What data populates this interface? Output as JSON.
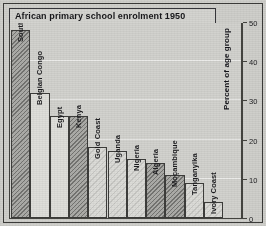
{
  "chart_data": {
    "type": "bar",
    "title": "African primary school enrolment 1950",
    "xlabel": "",
    "ylabel": "Percent of age group",
    "ylim": [
      0,
      50
    ],
    "yticks": [
      0,
      10,
      20,
      30,
      40,
      50
    ],
    "grid": true,
    "legend": "none",
    "categories": [
      "Southern Rhodesia",
      "Belgian Congo",
      "Egypt",
      "Kenya",
      "Gold Coast",
      "Uganda",
      "Nigeria",
      "Algeria",
      "Moçambique",
      "Tanganyika",
      "Ivory Coast"
    ],
    "values": [
      48,
      32,
      26,
      26,
      18,
      17,
      15,
      14,
      11,
      9,
      4
    ],
    "bar_fills": [
      "hatch-dark",
      "plain-light",
      "plain-light",
      "hatch-dark",
      "hatch-light",
      "hatch-light",
      "hatch-light",
      "hatch-dark",
      "hatch-dark",
      "hatch-light",
      "hatch-light"
    ]
  },
  "colors": {
    "page_background": "#cfcfcb",
    "plot_background": "#d2d2ce",
    "frame": "#43433f",
    "text": "#17171a",
    "bar_dark": "#acaca8",
    "bar_light": "#dcdcd8"
  }
}
